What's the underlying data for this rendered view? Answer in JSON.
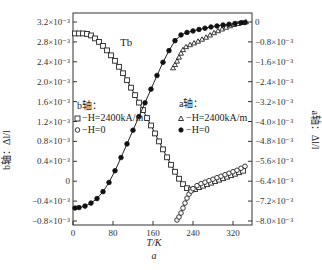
{
  "chart_data": {
    "type": "line",
    "title": "Tb",
    "caption": "a",
    "xlabel": "T/K",
    "ylabel_left": "b轴：Δl/l",
    "ylabel_right": "a轴：Δl/l",
    "xlim": [
      0,
      360
    ],
    "ylim_left": [
      -0.0008,
      0.0032
    ],
    "ylim_right": [
      -0.008,
      0
    ],
    "x_ticks": [
      "0",
      "80",
      "160",
      "240",
      "320"
    ],
    "x_tick_values": [
      0,
      80,
      160,
      240,
      320
    ],
    "left_ticks": [
      "3.2×10⁻³",
      "2.8×10⁻³",
      "2.4×10⁻³",
      "2.0×10⁻³",
      "1.6×10⁻³",
      "1.2×10⁻³",
      "0.8×10⁻³",
      "0.4×10⁻³",
      "0",
      "−0.4×10⁻³",
      "−0.8×10⁻³"
    ],
    "left_tick_values": [
      0.0032,
      0.0028,
      0.0024,
      0.002,
      0.0016,
      0.0012,
      0.0008,
      0.0004,
      0,
      -0.0004,
      -0.0008
    ],
    "right_ticks": [
      "0",
      "−0.8×10⁻³",
      "−1.6×10⁻³",
      "−2.4×10⁻³",
      "−3.2×10⁻³",
      "−4.0×10⁻³",
      "−4.8×10⁻³",
      "−5.6×10⁻³",
      "−6.4×10⁻³",
      "−7.2×10⁻³",
      "−8.0×10⁻³"
    ],
    "right_tick_values": [
      0,
      -0.0008,
      -0.0016,
      -0.0024,
      -0.0032,
      -0.004,
      -0.0048,
      -0.0056,
      -0.0064,
      -0.0072,
      -0.008
    ],
    "grid": false,
    "legend": {
      "b_axis": {
        "title": "b轴：",
        "entries": [
          "−H=2400kA/m",
          "−H=0"
        ]
      },
      "a_axis": {
        "title": "a轴：",
        "entries": [
          "−H=2400kA/m",
          "−H=0"
        ]
      }
    },
    "series": [
      {
        "name": "b轴 H=2400kA/m",
        "axis": "left",
        "marker": "open-square",
        "x": [
          4,
          12,
          20,
          28,
          36,
          44,
          52,
          60,
          68,
          76,
          84,
          92,
          100,
          108,
          116,
          124,
          132,
          140,
          148,
          156,
          164,
          172,
          180,
          188,
          196,
          204,
          212,
          220,
          228,
          236,
          244,
          252,
          260,
          268,
          276,
          284,
          292,
          300,
          308,
          316,
          324,
          332,
          340
        ],
        "values": [
          0.00297,
          0.00297,
          0.00297,
          0.00296,
          0.00293,
          0.00287,
          0.0028,
          0.00272,
          0.00263,
          0.00253,
          0.00242,
          0.0023,
          0.00217,
          0.00203,
          0.00188,
          0.00173,
          0.00158,
          0.00143,
          0.00127,
          0.00112,
          0.00096,
          0.0008,
          0.00064,
          0.00048,
          0.00033,
          0.00019,
          5e-05,
          -6e-05,
          -0.00014,
          -0.00017,
          -0.00016,
          -0.00012,
          -9e-05,
          -6e-05,
          -3e-05,
          0.0,
          3e-05,
          6e-05,
          9e-05,
          0.00012,
          0.00015,
          0.00018,
          0.00021
        ]
      },
      {
        "name": "b轴 H=0",
        "axis": "left",
        "marker": "open-circle",
        "x": [
          208,
          212,
          216,
          220,
          224,
          228,
          232,
          236,
          240,
          248,
          256,
          264,
          272,
          280,
          288,
          296,
          304,
          312,
          320,
          328,
          336,
          344
        ],
        "values": [
          -0.00078,
          -0.00072,
          -0.00064,
          -0.00054,
          -0.00044,
          -0.00034,
          -0.00026,
          -0.0002,
          -0.00015,
          -9e-05,
          -5e-05,
          -2e-05,
          1e-05,
          4e-05,
          7e-05,
          0.0001,
          0.00013,
          0.00016,
          0.00019,
          0.00022,
          0.00026,
          0.0003
        ]
      },
      {
        "name": "a轴 H=2400kA/m",
        "axis": "right",
        "marker": "open-triangle",
        "x": [
          200,
          204,
          208,
          212,
          216,
          220,
          226,
          234,
          242,
          250,
          258,
          266,
          274,
          282,
          290,
          298,
          306,
          314,
          322,
          330,
          338,
          346
        ],
        "values": [
          -0.00185,
          -0.00172,
          -0.00158,
          -0.00142,
          -0.00126,
          -0.00112,
          -0.001,
          -0.00092,
          -0.00085,
          -0.00078,
          -0.0007,
          -0.00062,
          -0.00053,
          -0.00044,
          -0.00036,
          -0.00029,
          -0.00022,
          -0.00016,
          -0.00011,
          -7e-05,
          -3e-05,
          0.0
        ]
      },
      {
        "name": "a轴 H=0",
        "axis": "right",
        "marker": "filled-circle",
        "x": [
          4,
          12,
          24,
          36,
          48,
          60,
          72,
          84,
          96,
          108,
          120,
          132,
          144,
          156,
          168,
          180,
          192,
          204,
          216,
          228,
          240,
          252,
          264,
          276,
          288,
          300,
          312,
          324,
          336,
          344
        ],
        "values": [
          -0.00748,
          -0.00746,
          -0.0074,
          -0.00728,
          -0.0071,
          -0.00682,
          -0.00645,
          -0.00598,
          -0.00545,
          -0.0049,
          -0.00435,
          -0.0038,
          -0.00325,
          -0.0027,
          -0.00215,
          -0.00162,
          -0.00115,
          -0.00075,
          -0.00052,
          -0.00042,
          -0.00036,
          -0.0003,
          -0.00025,
          -0.0002,
          -0.00016,
          -0.00012,
          -9e-05,
          -6e-05,
          -3e-05,
          -2e-05
        ]
      }
    ]
  },
  "labels": {
    "plot_title": "Tb",
    "xlabel": "T/K",
    "caption": "a",
    "ylabel_left": "b轴：Δl/l",
    "ylabel_right": "a轴：Δl/l",
    "legend_b_title": "b轴：",
    "legend_b_entry1": "−H=2400kA/m",
    "legend_b_entry2": "−H=0",
    "legend_a_title": "a轴：",
    "legend_a_entry1": "−H=2400kA/m",
    "legend_a_entry2": "−H=0"
  }
}
